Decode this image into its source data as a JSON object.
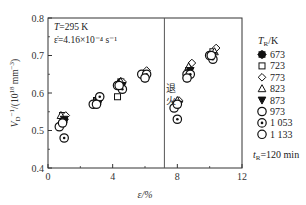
{
  "chart_data": {
    "type": "scatter",
    "title": "",
    "xlabel": "ε/%",
    "ylabel": "V_D^-1/(10^18 mm^-3)",
    "xlim": [
      0,
      12
    ],
    "ylim": [
      0.4,
      0.8
    ],
    "xticks": [
      0,
      4,
      8,
      12
    ],
    "yticks": [
      0.4,
      0.5,
      0.6,
      0.7,
      0.8
    ],
    "grid": false,
    "annotations": {
      "conditions_line1": "T=295 K",
      "conditions_line2": "ε̇=4.16×10⁻⁴ s⁻¹",
      "anneal_label": "退火",
      "anneal_x": 7.2,
      "time_label": "t_R=120 min"
    },
    "legend_title": "T_R/K",
    "legend_position": "right",
    "series": [
      {
        "name": "673",
        "marker": "asterisk",
        "points": [
          [
            1.0,
            0.53
          ],
          [
            3.1,
            0.58
          ],
          [
            4.5,
            0.63
          ],
          [
            6.0,
            0.64
          ],
          [
            8.0,
            0.57
          ],
          [
            8.6,
            0.64
          ],
          [
            10.1,
            0.7
          ]
        ]
      },
      {
        "name": "723",
        "marker": "square",
        "points": [
          [
            0.9,
            0.54
          ],
          [
            3.0,
            0.58
          ],
          [
            4.3,
            0.59
          ],
          [
            5.9,
            0.65
          ],
          [
            7.9,
            0.57
          ],
          [
            8.7,
            0.66
          ],
          [
            10.2,
            0.71
          ]
        ]
      },
      {
        "name": "773",
        "marker": "diamond",
        "points": [
          [
            1.1,
            0.54
          ],
          [
            3.2,
            0.59
          ],
          [
            4.6,
            0.63
          ],
          [
            6.1,
            0.66
          ],
          [
            8.1,
            0.58
          ],
          [
            8.9,
            0.68
          ],
          [
            10.4,
            0.72
          ]
        ]
      },
      {
        "name": "823",
        "marker": "triangle-up",
        "points": [
          [
            0.8,
            0.54
          ],
          [
            3.0,
            0.58
          ],
          [
            4.5,
            0.63
          ],
          [
            6.0,
            0.65
          ],
          [
            8.0,
            0.58
          ],
          [
            8.7,
            0.67
          ],
          [
            10.3,
            0.71
          ]
        ]
      },
      {
        "name": "873",
        "marker": "triangle-down",
        "points": [
          [
            1.0,
            0.53
          ],
          [
            3.1,
            0.58
          ],
          [
            4.6,
            0.62
          ],
          [
            6.1,
            0.64
          ],
          [
            8.1,
            0.57
          ],
          [
            8.8,
            0.66
          ],
          [
            10.2,
            0.7
          ]
        ]
      },
      {
        "name": "973",
        "marker": "circle",
        "points": [
          [
            0.7,
            0.51
          ],
          [
            2.8,
            0.57
          ],
          [
            4.3,
            0.62
          ],
          [
            5.8,
            0.65
          ],
          [
            7.8,
            0.56
          ],
          [
            8.6,
            0.65
          ],
          [
            10.0,
            0.7
          ]
        ]
      },
      {
        "name": "1 053",
        "marker": "circle-dot",
        "points": [
          [
            1.0,
            0.48
          ],
          [
            3.2,
            0.59
          ],
          [
            4.6,
            0.61
          ],
          [
            6.1,
            0.65
          ],
          [
            8.0,
            0.53
          ],
          [
            8.8,
            0.65
          ],
          [
            10.2,
            0.69
          ]
        ]
      },
      {
        "name": "1 133",
        "marker": "circle",
        "points": [
          [
            0.9,
            0.52
          ],
          [
            3.0,
            0.57
          ],
          [
            4.4,
            0.62
          ],
          [
            6.0,
            0.64
          ],
          [
            8.0,
            0.57
          ],
          [
            8.6,
            0.64
          ],
          [
            10.1,
            0.7
          ]
        ]
      }
    ],
    "filled_markers": {
      "673": "#111",
      "873": "#111"
    }
  }
}
